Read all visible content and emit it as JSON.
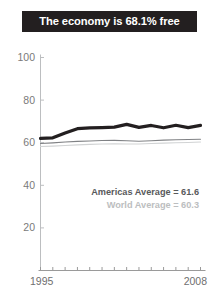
{
  "title": {
    "text": "The economy is 68.1% free"
  },
  "legend": {
    "americas_label": "Americas Average = 61.6",
    "world_label": "World Average = 60.3"
  },
  "colors": {
    "title_background": "#231f20",
    "title_text": "#ffffff",
    "country_line": "#231f20",
    "americas_line": "#808285",
    "world_line": "#d1d3d4",
    "axis": "#bcbec0",
    "tick_label": "#7a7a7a"
  },
  "chart_data": {
    "type": "line",
    "title": "The economy is 68.1% free",
    "xlabel": "",
    "ylabel": "",
    "xlim": [
      1995,
      2008
    ],
    "ylim": [
      0,
      100
    ],
    "grid": false,
    "legend_position": "inside-bottom-right",
    "x": [
      1995,
      1996,
      1997,
      1998,
      1999,
      2000,
      2001,
      2002,
      2003,
      2004,
      2005,
      2006,
      2007,
      2008
    ],
    "xticks": [
      1995,
      1996,
      1997,
      1998,
      1999,
      2000,
      2001,
      2002,
      2003,
      2004,
      2005,
      2006,
      2007,
      2008
    ],
    "xtick_labels_shown": [
      "1995",
      "2008"
    ],
    "yticks": [
      20,
      40,
      60,
      80,
      100
    ],
    "ytick_labels": [
      "20",
      "40",
      "60",
      "80",
      "100"
    ],
    "series": [
      {
        "name": "Country score",
        "color": "#231f20",
        "width": 3.2,
        "values": [
          62.0,
          62.3,
          64.6,
          66.6,
          67.0,
          67.1,
          67.3,
          68.6,
          67.2,
          68.1,
          67.0,
          68.2,
          67.1,
          68.1
        ]
      },
      {
        "name": "Americas Average",
        "color": "#808285",
        "width": 1.1,
        "values": [
          59.6,
          59.9,
          60.3,
          60.6,
          60.8,
          61.0,
          61.1,
          60.9,
          60.7,
          60.9,
          61.2,
          61.4,
          61.5,
          61.6
        ]
      },
      {
        "name": "World Average",
        "color": "#d1d3d4",
        "width": 1.1,
        "values": [
          58.2,
          58.4,
          58.7,
          59.0,
          59.2,
          59.4,
          59.5,
          59.4,
          59.4,
          59.6,
          59.8,
          60.0,
          60.1,
          60.3
        ]
      }
    ],
    "annotations": [
      {
        "text": "Americas Average = 61.6",
        "value": 61.6
      },
      {
        "text": "World Average = 60.3",
        "value": 60.3
      }
    ]
  }
}
